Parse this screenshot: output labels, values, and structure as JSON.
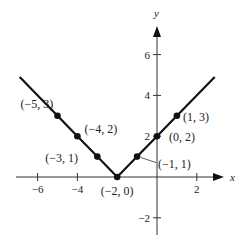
{
  "chart_data": {
    "type": "line",
    "title": "",
    "xlabel": "x",
    "ylabel": "y",
    "xlim": [
      -7,
      3.5
    ],
    "ylim": [
      -3,
      7.5
    ],
    "x_ticks": [
      -6,
      -4,
      2
    ],
    "y_ticks": [
      6,
      4,
      2,
      -2
    ],
    "x_tick_labels": [
      "−6",
      "−4",
      "2"
    ],
    "y_tick_labels": [
      "6",
      "4",
      "2",
      "−2"
    ],
    "grid": false,
    "legend": null,
    "function": "y = |x + 2|",
    "series": [
      {
        "name": "y = |x + 2|",
        "x": [
          -6.9,
          -5,
          -4,
          -3,
          -2,
          -1,
          0,
          1,
          2.9
        ],
        "y": [
          4.9,
          3,
          2,
          1,
          0,
          1,
          2,
          3,
          4.9
        ]
      }
    ],
    "points": [
      {
        "x": -5,
        "y": 3,
        "label": "(−5, 3)"
      },
      {
        "x": -4,
        "y": 2,
        "label": "(−4, 2)"
      },
      {
        "x": -3,
        "y": 1,
        "label": "(−3, 1)"
      },
      {
        "x": -2,
        "y": 0,
        "label": "(−2, 0)"
      },
      {
        "x": -1,
        "y": 1,
        "label": "(−1, 1)"
      },
      {
        "x": 0,
        "y": 2,
        "label": "(0, 2)"
      },
      {
        "x": 1,
        "y": 3,
        "label": "(1, 3)"
      }
    ]
  }
}
